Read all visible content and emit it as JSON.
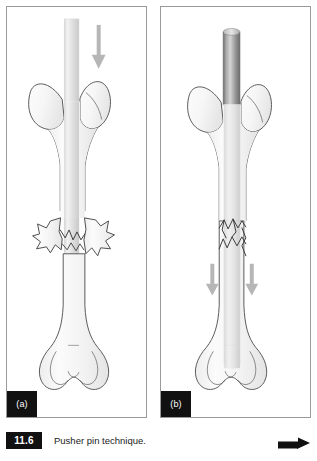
{
  "figure": {
    "number": "11.6",
    "caption": "Pusher pin technique.",
    "corner_arrow_icon": "right-arrow-icon"
  },
  "panels": [
    {
      "id": "a",
      "label": "(a)",
      "description": "Femur with displaced comminuted mid-shaft fracture; pusher pin entering through the greater trochanter, driven downward",
      "arrows": [
        {
          "name": "downward-force-arrow",
          "direction": "down",
          "color": "#b6b6b6"
        }
      ],
      "pin": {
        "name": "pusher-pin",
        "style": "tapered",
        "color_top": "#e2e2e2",
        "color_body": "#cfcfcf"
      },
      "fracture": {
        "name": "comminuted-fracture",
        "state": "displaced"
      }
    },
    {
      "id": "b",
      "label": "(b)",
      "description": "Femur with fracture reduced; pusher pin advanced down the medullary canal past the fracture site to the distal femur",
      "arrows": [
        {
          "name": "downward-force-arrow-left",
          "direction": "down",
          "color": "#b6b6b6"
        },
        {
          "name": "downward-force-arrow-right",
          "direction": "down",
          "color": "#b6b6b6"
        }
      ],
      "pin": {
        "name": "pusher-pin",
        "style": "cylindrical",
        "color_top": "#cfcfcf",
        "color_body": "#8f8f8f"
      },
      "fracture": {
        "name": "comminuted-fracture",
        "state": "reduced"
      }
    }
  ],
  "colors": {
    "bone_fill": "#f4f4f4",
    "bone_outline": "#555555",
    "panel_border": "#9a9a9a",
    "badge_background": "#111111",
    "badge_text": "#ffffff",
    "arrow_gray": "#b6b6b6",
    "page_background": "#ffffff"
  }
}
